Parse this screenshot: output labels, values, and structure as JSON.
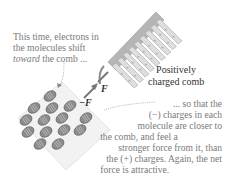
{
  "caption_top": {
    "lines": [
      "This time, electrons in",
      "the molecules shift"
    ],
    "emphasis": "toward",
    "line3_rest": " the comb ..."
  },
  "comb_label": [
    "Positively",
    "charged comb"
  ],
  "force_labels": {
    "on_comb": "F",
    "on_molecule": "−F"
  },
  "caption_bottom": {
    "lines": [
      "... so that the",
      "(−) charges in each",
      "molecule are closer to",
      "the comb, and feel a",
      "stronger force from it, than",
      "the (+) charges. Again, the net",
      "force is attractive."
    ]
  },
  "comb_charge_symbol": "×",
  "colors": {
    "text": "#7a7a7a",
    "comb": "#b8b8b8",
    "molecule": "#8a8a8a",
    "paper": "#f0f0f0"
  }
}
